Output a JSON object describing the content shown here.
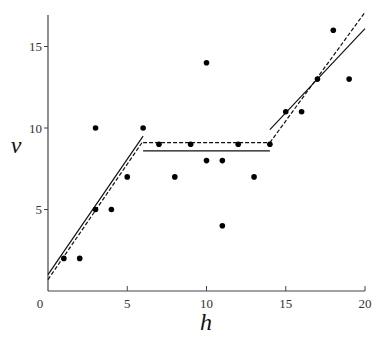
{
  "chart_data": {
    "type": "scatter",
    "title": "",
    "xlabel": "h",
    "ylabel": "v",
    "xlim": [
      0,
      20
    ],
    "ylim": [
      0,
      17
    ],
    "grid": false,
    "legend": null,
    "x_ticks": [
      0,
      5,
      10,
      15,
      20
    ],
    "y_ticks": [
      5,
      10,
      15
    ],
    "points": [
      {
        "h": 1,
        "v": 2
      },
      {
        "h": 2,
        "v": 2
      },
      {
        "h": 3,
        "v": 5
      },
      {
        "h": 3,
        "v": 10
      },
      {
        "h": 4,
        "v": 5
      },
      {
        "h": 5,
        "v": 7
      },
      {
        "h": 6,
        "v": 10
      },
      {
        "h": 7,
        "v": 9
      },
      {
        "h": 8,
        "v": 7
      },
      {
        "h": 9,
        "v": 9
      },
      {
        "h": 10,
        "v": 14
      },
      {
        "h": 10,
        "v": 8
      },
      {
        "h": 11,
        "v": 8
      },
      {
        "h": 11,
        "v": 4
      },
      {
        "h": 12,
        "v": 9
      },
      {
        "h": 13,
        "v": 7
      },
      {
        "h": 14,
        "v": 9
      },
      {
        "h": 15,
        "v": 11
      },
      {
        "h": 16,
        "v": 11
      },
      {
        "h": 17,
        "v": 13
      },
      {
        "h": 18,
        "v": 16
      },
      {
        "h": 19,
        "v": 13
      }
    ],
    "series": [
      {
        "name": "solid-fit",
        "style": "solid",
        "segments": [
          [
            [
              0,
              1.0
            ],
            [
              6,
              9.5
            ]
          ],
          [
            [
              6,
              8.6
            ],
            [
              14,
              8.6
            ]
          ],
          [
            [
              14,
              9.9
            ],
            [
              20,
              16.1
            ]
          ]
        ]
      },
      {
        "name": "dashed-fit",
        "style": "dashed",
        "segments": [
          [
            [
              0,
              0.7
            ],
            [
              6,
              9.2
            ]
          ],
          [
            [
              6,
              9.1
            ],
            [
              14,
              9.1
            ]
          ],
          [
            [
              14,
              9.1
            ],
            [
              20,
              17.1
            ]
          ]
        ]
      }
    ]
  },
  "layout": {
    "x0_px": 48,
    "x_px_per_unit": 15.85,
    "y0_px": 291,
    "y_px_per_unit": 16.3,
    "axis_top_px": 15,
    "axis_right_px": 365
  }
}
